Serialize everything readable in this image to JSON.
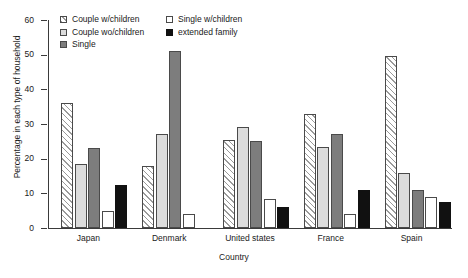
{
  "chart_data": {
    "type": "bar",
    "title": "",
    "xlabel": "Country",
    "ylabel": "Percentage in each type of household",
    "ylim": [
      0,
      60
    ],
    "yticks": [
      0,
      10,
      20,
      30,
      40,
      50,
      60
    ],
    "grid": false,
    "legend_position": "top-left",
    "categories": [
      "Japan",
      "Denmark",
      "United states",
      "France",
      "Spain"
    ],
    "series": [
      {
        "name": "Couple w/children",
        "key": "couple-w",
        "swatch": "hatched",
        "color": "#ffffff",
        "values": [
          36,
          18,
          25.5,
          33,
          49.5
        ]
      },
      {
        "name": "Couple wo/children",
        "key": "couple-wo",
        "swatch": "light-gray",
        "color": "#dcdcdc",
        "values": [
          18.5,
          27,
          29,
          23.5,
          16
        ]
      },
      {
        "name": "Single",
        "key": "single",
        "swatch": "gray",
        "color": "#7d7d7d",
        "values": [
          23,
          51,
          25,
          27,
          11
        ]
      },
      {
        "name": "Single w/children",
        "key": "single-w",
        "swatch": "white",
        "color": "#ffffff",
        "values": [
          5,
          4,
          8.5,
          4,
          9
        ]
      },
      {
        "name": "extended family",
        "key": "extended",
        "swatch": "black",
        "color": "#111111",
        "values": [
          12.5,
          0,
          6,
          11,
          7.5
        ]
      }
    ]
  }
}
